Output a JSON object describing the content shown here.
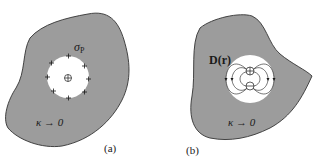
{
  "colors": {
    "medium_fill": "#9c9c9c",
    "outline": "#333333",
    "cavity": "#ffffff",
    "ink": "#1a1a1a"
  },
  "panel_a": {
    "caption": "(a)",
    "charge_label_base": "σ",
    "charge_label_sub": "P",
    "center_symbol": "⊕",
    "surface_charge_symbol": "+",
    "conductivity_label": "κ → 0"
  },
  "panel_b": {
    "caption": "(b)",
    "field_label": "D(r)",
    "dipole_positive_symbol": "⊕",
    "dipole_negative_symbol": "⊖",
    "conductivity_label": "κ → 0"
  }
}
